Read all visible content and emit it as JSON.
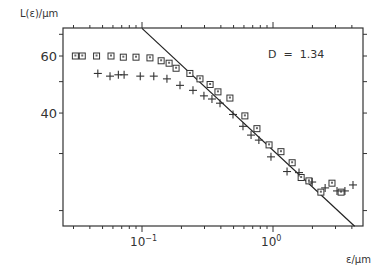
{
  "chart_data": {
    "type": "scatter",
    "title": "",
    "xlabel": "ε/μm",
    "ylabel": "L(ε)/μm",
    "xscale": "log",
    "yscale": "log",
    "xlim": [
      0.025,
      4.9
    ],
    "ylim": [
      17.5,
      73
    ],
    "x_ticks": [
      {
        "value": 0.1,
        "label": "10^-1",
        "base": "10",
        "exp": "−1"
      },
      {
        "value": 1,
        "label": "10^0",
        "base": "10",
        "exp": "0"
      }
    ],
    "y_ticks": [
      {
        "value": 60,
        "label": "60"
      },
      {
        "value": 40,
        "label": "40"
      }
    ],
    "y_minor_ticks": [
      70,
      50,
      30,
      20
    ],
    "grid": false,
    "annotation": "D  =  1.34",
    "series": [
      {
        "name": "squares",
        "marker": "square",
        "points": [
          [
            0.031,
            60
          ],
          [
            0.035,
            60
          ],
          [
            0.045,
            60
          ],
          [
            0.058,
            60
          ],
          [
            0.072,
            59.5
          ],
          [
            0.09,
            59.5
          ],
          [
            0.115,
            59.2
          ],
          [
            0.14,
            58
          ],
          [
            0.161,
            57
          ],
          [
            0.182,
            55
          ],
          [
            0.232,
            53
          ],
          [
            0.277,
            51
          ],
          [
            0.331,
            49
          ],
          [
            0.38,
            46.5
          ],
          [
            0.469,
            44.5
          ],
          [
            0.61,
            39.2
          ],
          [
            0.754,
            35.8
          ],
          [
            0.933,
            31.9
          ],
          [
            1.15,
            30.4
          ],
          [
            1.4,
            28.1
          ],
          [
            1.64,
            25.3
          ],
          [
            1.88,
            24.7
          ],
          [
            2.32,
            22.8
          ],
          [
            2.82,
            24.3
          ],
          [
            3.31,
            22.8
          ]
        ]
      },
      {
        "name": "crosses",
        "marker": "plus",
        "points": [
          [
            0.046,
            53
          ],
          [
            0.057,
            52
          ],
          [
            0.066,
            52.5
          ],
          [
            0.073,
            52.5
          ],
          [
            0.097,
            52
          ],
          [
            0.123,
            52
          ],
          [
            0.155,
            51
          ],
          [
            0.195,
            48.7
          ],
          [
            0.245,
            47
          ],
          [
            0.297,
            45.2
          ],
          [
            0.342,
            44.2
          ],
          [
            0.394,
            42.9
          ],
          [
            0.495,
            39.6
          ],
          [
            0.59,
            36.4
          ],
          [
            0.68,
            34.2
          ],
          [
            0.78,
            33
          ],
          [
            0.965,
            29.3
          ],
          [
            1.28,
            26.4
          ],
          [
            1.58,
            26.2
          ],
          [
            1.99,
            24.5
          ],
          [
            2.5,
            23.5
          ],
          [
            3.08,
            23
          ],
          [
            3.54,
            23
          ],
          [
            4.08,
            24
          ]
        ]
      }
    ],
    "fit_line": {
      "name": "fractal fit",
      "D": 1.34,
      "from": [
        0.1,
        73
      ],
      "to": [
        4.2,
        17.9
      ]
    }
  }
}
